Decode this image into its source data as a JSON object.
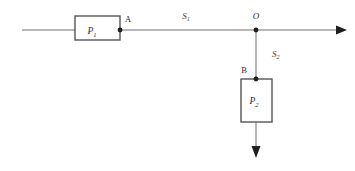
{
  "diagram": {
    "background_color": "#ffffff",
    "line_color": "#6e6e6e",
    "box_border_color": "#555555",
    "text_color": "#2b2b2b",
    "components": [
      {
        "id": "P1",
        "label": "P",
        "subscript": "1",
        "shape": "rectangle",
        "orientation": "horizontal"
      },
      {
        "id": "P2",
        "label": "P",
        "subscript": "2",
        "shape": "rectangle",
        "orientation": "vertical"
      }
    ],
    "nodes": [
      {
        "id": "A",
        "label": "A",
        "style": "upright"
      },
      {
        "id": "O",
        "label": "O",
        "style": "italic"
      },
      {
        "id": "B",
        "label": "B",
        "style": "upright"
      }
    ],
    "segments": [
      {
        "id": "S1",
        "label": "S",
        "subscript": "1",
        "from": "A",
        "to": "O"
      },
      {
        "id": "S2",
        "label": "S",
        "subscript": "2",
        "from": "O",
        "to": "B"
      }
    ],
    "flow_arrows": [
      {
        "id": "main-outlet",
        "direction": "right"
      },
      {
        "id": "branch-outlet",
        "direction": "down"
      }
    ]
  }
}
